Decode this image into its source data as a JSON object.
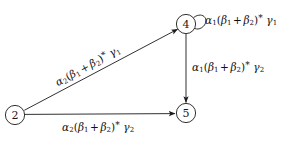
{
  "diagram": {
    "type": "state-transition-graph",
    "background_color": "#ffffff",
    "stroke_color": "#1a1a1a",
    "nodes": [
      {
        "id": "node-2",
        "label": "2",
        "cx": 15,
        "cy": 115,
        "r": 10
      },
      {
        "id": "node-4",
        "label": "4",
        "cx": 186,
        "cy": 24,
        "r": 10
      },
      {
        "id": "node-5",
        "label": "5",
        "cx": 186,
        "cy": 113,
        "r": 10
      }
    ],
    "edges": [
      {
        "id": "edge-2-4",
        "from": "2",
        "to": "4",
        "kind": "diagonal",
        "label_parts": {
          "head": "α",
          "head_sub": "2",
          "open": "(",
          "b1": "β",
          "b1_sub": "1",
          "plus": "+",
          "b2": "β",
          "b2_sub": "2",
          "close": ")",
          "star": "*",
          "tail": "γ",
          "tail_sub": "1"
        },
        "label_text": "α₂(β₁ + β₂)* γ₁"
      },
      {
        "id": "edge-2-5",
        "from": "2",
        "to": "5",
        "kind": "horizontal",
        "label_parts": {
          "head": "α",
          "head_sub": "2",
          "open": "(",
          "b1": "β",
          "b1_sub": "1",
          "plus": "+",
          "b2": "β",
          "b2_sub": "2",
          "close": ")",
          "star": "*",
          "tail": "γ",
          "tail_sub": "2"
        },
        "label_text": "α₂(β₁ + β₂)* γ₂"
      },
      {
        "id": "edge-4-5",
        "from": "4",
        "to": "5",
        "kind": "vertical",
        "label_parts": {
          "head": "α",
          "head_sub": "1",
          "open": "(",
          "b1": "β",
          "b1_sub": "1",
          "plus": "+",
          "b2": "β",
          "b2_sub": "2",
          "close": ")",
          "star": "*",
          "tail": "γ",
          "tail_sub": "2"
        },
        "label_text": "α₁(β₁ + β₂)* γ₂"
      },
      {
        "id": "edge-4-4",
        "from": "4",
        "to": "4",
        "kind": "self-loop",
        "label_parts": {
          "head": "α",
          "head_sub": "1",
          "open": "(",
          "b1": "β",
          "b1_sub": "1",
          "plus": "+",
          "b2": "β",
          "b2_sub": "2",
          "close": ")",
          "star": "*",
          "tail": "γ",
          "tail_sub": "1"
        },
        "label_text": "α₁(β₁ + β₂)* γ₁"
      }
    ]
  }
}
